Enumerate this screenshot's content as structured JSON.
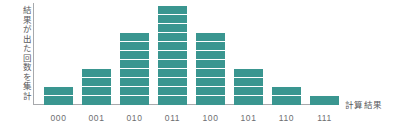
{
  "chart_data": {
    "type": "bar",
    "title": "",
    "subtitle": "",
    "xlabel": "計算結果",
    "ylabel": "結果が出た回数を集計",
    "categories": [
      "000",
      "001",
      "010",
      "011",
      "100",
      "101",
      "110",
      "111"
    ],
    "values": [
      2,
      4,
      8,
      11,
      8,
      4,
      2,
      1
    ],
    "series": [
      {
        "name": "結果が出た回数",
        "values": [
          2,
          4,
          8,
          11,
          8,
          4,
          2,
          1
        ]
      }
    ],
    "ylim": [
      0,
      11
    ],
    "grid": false,
    "legend": "none",
    "bar_style": "segmented-stacked-units",
    "bar_color": "#3a9690",
    "axis_color": "#a7a9ac",
    "label_color": "#6d6e71",
    "background": "#ffffff",
    "annotations": []
  },
  "axes": {
    "y_label_text": "結果が出た回数を集計",
    "x_label_text": "計算結果"
  }
}
